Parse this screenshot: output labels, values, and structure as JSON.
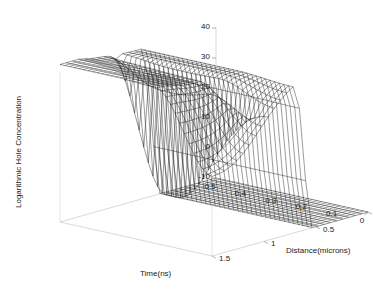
{
  "chart_data": {
    "type": "surface",
    "title": "",
    "xlabel": "Time(ns)",
    "ylabel": "Distance(microns)",
    "zlabel": "Logarithmic Hole Concentration",
    "xlim": [
      0,
      0.5
    ],
    "ylim": [
      0,
      1.5
    ],
    "zlim": [
      -10,
      40
    ],
    "xticks": [
      "0.5",
      "0.4",
      "0.3",
      "0.2",
      "0.1",
      "0"
    ],
    "xtick_values": [
      0.5,
      0.4,
      0.3,
      0.2,
      0.1,
      0
    ],
    "yticks": [
      "1.5",
      "1",
      "0.5",
      "0"
    ],
    "ytick_values": [
      1.5,
      1.0,
      0.5,
      0
    ],
    "zticks": [
      "40",
      "30",
      "20",
      "10",
      "0",
      "-10"
    ],
    "ztick_values": [
      40,
      30,
      20,
      10,
      0,
      -10
    ],
    "grid": false,
    "legend": "none",
    "mesh_color": "#000000",
    "background_color": "#ffffff",
    "axis_color": "#b4b4b4",
    "view": {
      "azimuth": -37.5,
      "elevation": 30
    },
    "nx": 34,
    "ny": 26,
    "surface_model": {
      "plateau_level": 40,
      "floor_level": -10,
      "cliff_center_y": 0.62,
      "cliff_width": 0.085,
      "notch_center_y": 0.97,
      "notch_width": 0.035,
      "notch_depth": 46,
      "front_rolloff_x": 0.085,
      "back_rise": 2.0
    }
  },
  "axis_titles": {
    "time": "Time(ns)",
    "distance": "Distance(microns)",
    "concentration": "Logarithmic Hole Concentration"
  }
}
